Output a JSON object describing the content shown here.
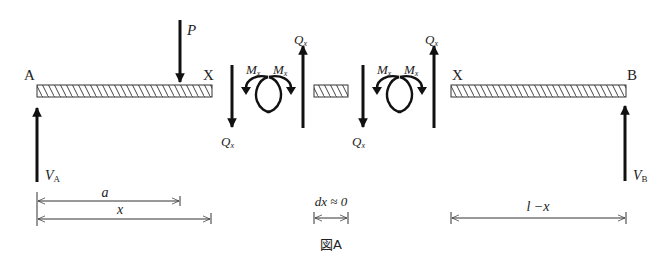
{
  "figure": {
    "caption": "図A",
    "colors": {
      "ink": "#1a1a1a",
      "background": "#ffffff",
      "hatch": "#555555"
    }
  },
  "labels": {
    "support_a": "A",
    "support_b": "B",
    "cut_left": "X",
    "cut_right": "X",
    "load_p": "P",
    "reaction_a_main": "V",
    "reaction_a_sub": "A",
    "reaction_b_main": "V",
    "reaction_b_sub": "B",
    "shear_main": "Q",
    "shear_sub": "x",
    "moment_main": "M",
    "moment_sub": "x"
  },
  "dimensions": {
    "a": "a",
    "x": "x",
    "dx": "dx ≈ 0",
    "l_minus_x": "l −x"
  },
  "elements": {
    "beams": [
      {
        "name": "left-segment",
        "x1": 37,
        "x2": 212
      },
      {
        "name": "middle-element",
        "x1": 314,
        "x2": 348
      },
      {
        "name": "right-segment",
        "x1": 451,
        "x2": 626
      }
    ],
    "arrows": [
      {
        "name": "load-p",
        "direction": "down"
      },
      {
        "name": "reaction-va",
        "direction": "up"
      },
      {
        "name": "reaction-vb",
        "direction": "up"
      },
      {
        "name": "shear-left-cut-down",
        "direction": "down"
      },
      {
        "name": "shear-left-cut-up",
        "direction": "up"
      },
      {
        "name": "shear-right-cut-down",
        "direction": "down"
      },
      {
        "name": "shear-right-cut-up",
        "direction": "up"
      }
    ]
  }
}
